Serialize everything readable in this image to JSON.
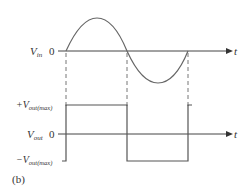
{
  "figure": {
    "caption": "(b)",
    "input_waveform": {
      "label_main": "V",
      "label_sub": "in",
      "zero_label": "0",
      "axis_label": "t",
      "shape": "sine"
    },
    "output_waveform": {
      "label_main": "V",
      "label_sub": "out",
      "zero_label": "0",
      "axis_label": "t",
      "shape": "square",
      "pos_level_label_prefix": "+V",
      "pos_level_label_sub": "out(max)",
      "neg_level_label_prefix": "−V",
      "neg_level_label_sub": "out(max)"
    },
    "colors": {
      "line": "#555555",
      "text": "#333333",
      "dashed": "#666666"
    }
  }
}
